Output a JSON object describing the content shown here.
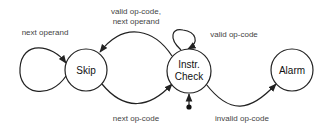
{
  "diagram": {
    "type": "state-machine",
    "states": [
      {
        "id": "skip",
        "label_lines": [
          "Skip"
        ]
      },
      {
        "id": "check",
        "label_lines": [
          "Instr.",
          "Check"
        ]
      },
      {
        "id": "alarm",
        "label_lines": [
          "Alarm"
        ]
      }
    ],
    "initial_state": "check",
    "transitions": [
      {
        "from": "skip",
        "to": "skip",
        "label": "next operand"
      },
      {
        "from": "check",
        "to": "skip",
        "label_lines": [
          "valid op-code,",
          "next operand"
        ]
      },
      {
        "from": "skip",
        "to": "check",
        "label": "next op-code"
      },
      {
        "from": "check",
        "to": "check",
        "label": "valid op-code"
      },
      {
        "from": "check",
        "to": "alarm",
        "label": "invalid op-code"
      }
    ]
  }
}
